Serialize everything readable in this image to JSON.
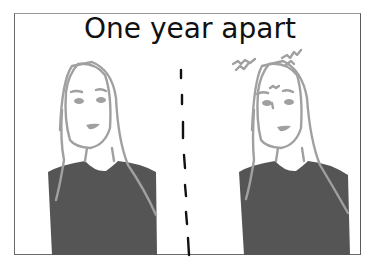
{
  "comic": {
    "caption": "One year apart",
    "panels": [
      {
        "label": "before",
        "description": "Person with long hair, calm expression"
      },
      {
        "label": "after",
        "description": "Same person with frazzled hair and worried brow"
      }
    ],
    "colors": {
      "line": "#a0a0a0",
      "shirt": "#555555",
      "text": "#111111",
      "divider": "#111111",
      "border": "#6a6a6a"
    }
  }
}
